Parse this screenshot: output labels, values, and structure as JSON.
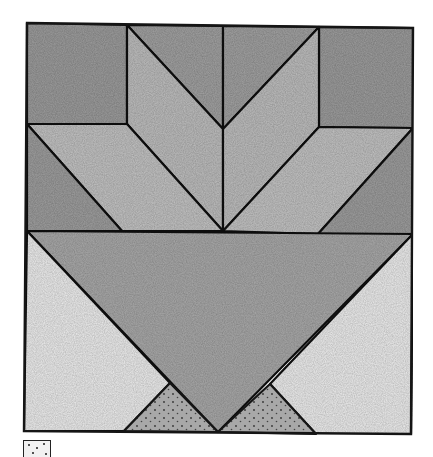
{
  "figure": {
    "type": "quilt-block-diagram",
    "colors": {
      "outline": "#151515",
      "dark_fill": "#9a9a9a",
      "medium_fill": "#b4b4b4",
      "light_fill": "#c7c7c7",
      "basket_fill": "#a8a8a8",
      "background_fill": "#e9e9e9",
      "dotted_fill": "#a3a3a3"
    },
    "pieces": [
      {
        "id": "top-left-square",
        "shade": "dark"
      },
      {
        "id": "top-center-left-triangle",
        "shade": "dark"
      },
      {
        "id": "top-center-right-triangle",
        "shade": "dark"
      },
      {
        "id": "top-right-square",
        "shade": "dark"
      },
      {
        "id": "left-upper-parallelogram",
        "shade": "light"
      },
      {
        "id": "right-upper-parallelogram",
        "shade": "light"
      },
      {
        "id": "left-lower-parallelogram",
        "shade": "light"
      },
      {
        "id": "right-lower-parallelogram",
        "shade": "light"
      },
      {
        "id": "middle-left-triangle",
        "shade": "dark"
      },
      {
        "id": "middle-right-triangle",
        "shade": "dark"
      },
      {
        "id": "basket-triangle",
        "shade": "medium"
      },
      {
        "id": "bottom-left-background-triangle",
        "shade": "very-light"
      },
      {
        "id": "bottom-right-background-triangle",
        "shade": "very-light"
      },
      {
        "id": "bottom-left-dotted-triangle",
        "shade": "dotted"
      },
      {
        "id": "bottom-right-dotted-triangle",
        "shade": "dotted"
      }
    ]
  },
  "legend": {
    "swatch": "dotted",
    "label": ""
  }
}
